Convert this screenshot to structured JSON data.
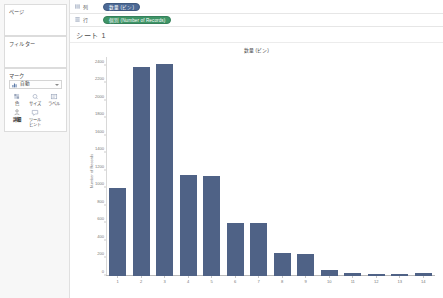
{
  "left_panel": {
    "pages_card": {
      "title": "ページ"
    },
    "filters_card": {
      "title": "フィルター"
    },
    "marks_card": {
      "title": "マーク",
      "mark_type": "自動",
      "mark_type_icon": "bar-chart-icon",
      "buttons": [
        {
          "label": "色",
          "icon": "color-icon",
          "emphasis": false
        },
        {
          "label": "サイズ",
          "icon": "size-icon",
          "emphasis": false
        },
        {
          "label": "ラベル",
          "icon": "label-icon",
          "emphasis": false
        },
        {
          "label": "詳細",
          "icon": "detail-icon",
          "emphasis": true
        },
        {
          "label": "ツール\nヒント",
          "icon": "tooltip-icon",
          "emphasis": false
        }
      ]
    }
  },
  "shelves": [
    {
      "name": "columns",
      "label": "列",
      "icon": "columns-icon",
      "pill": {
        "text": "数量 (ビン)",
        "color": "blue"
      }
    },
    {
      "name": "rows",
      "label": "行",
      "icon": "rows-icon",
      "pill": {
        "text": "個別 (Number of Records)",
        "color": "green"
      }
    }
  ],
  "sheet": {
    "title": "シート 1"
  },
  "colors": {
    "bar": "#4f6286",
    "pill_blue": "#4d6a96",
    "pill_green": "#3f9567",
    "panel_bg": "#f7f7f7"
  },
  "chart_data": {
    "type": "bar",
    "title": "数量 (ビン)",
    "xlabel": "",
    "ylabel": "Number of Records",
    "categories": [
      "1",
      "2",
      "3",
      "4",
      "5",
      "6",
      "7",
      "8",
      "9",
      "10",
      "11",
      "12",
      "13",
      "14"
    ],
    "values": [
      1000,
      2390,
      2420,
      1150,
      1140,
      600,
      600,
      260,
      255,
      70,
      40,
      25,
      20,
      30
    ],
    "ylim": [
      0,
      2500
    ],
    "yticks": [
      2400,
      2200,
      2000,
      1800,
      1600,
      1400,
      1200,
      1000,
      800,
      600,
      400,
      200,
      0
    ],
    "grid": false,
    "legend": "none"
  }
}
